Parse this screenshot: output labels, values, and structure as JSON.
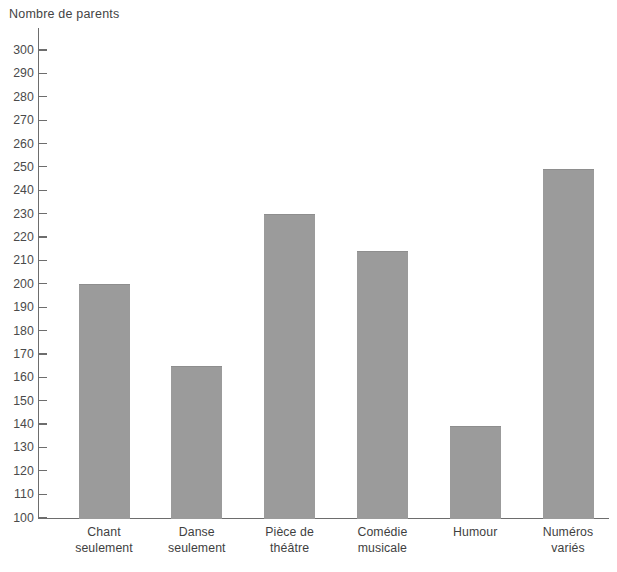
{
  "chart_data": {
    "type": "bar",
    "title": "",
    "ylabel": "Nombre de parents",
    "xlabel": "",
    "categories": [
      "Chant seulement",
      "Danse seulement",
      "Pièce de théâtre",
      "Comédie musicale",
      "Humour",
      "Numéros variés"
    ],
    "category_lines": [
      [
        "Chant",
        "seulement"
      ],
      [
        "Danse",
        "seulement"
      ],
      [
        "Pièce de",
        "théâtre"
      ],
      [
        "Comédie",
        "musicale"
      ],
      [
        "Humour",
        ""
      ],
      [
        "Numéros",
        "variés"
      ]
    ],
    "values": [
      200,
      165,
      230,
      214,
      139,
      249
    ],
    "ylim": [
      100,
      300
    ],
    "ytick_step": 10,
    "yticks": [
      "300",
      "290",
      "280",
      "270",
      "260",
      "250",
      "240",
      "230",
      "220",
      "210",
      "200",
      "190",
      "180",
      "170",
      "160",
      "150",
      "140",
      "130",
      "120",
      "110",
      "100"
    ],
    "grid": false,
    "legend": "none",
    "bar_color": "#9b9b9b",
    "axis_color": "#6d6d6d",
    "text_color": "#3f3f3f"
  }
}
